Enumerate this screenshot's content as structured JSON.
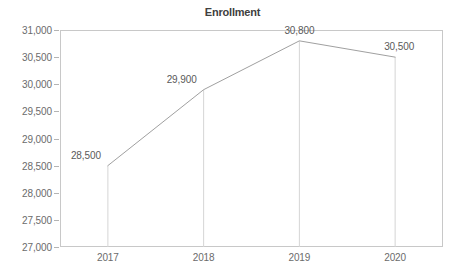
{
  "chart_data": {
    "type": "line",
    "title": "Enrollment",
    "xlabel": "",
    "ylabel": "",
    "categories": [
      "2017",
      "2018",
      "2019",
      "2020"
    ],
    "values": [
      28500,
      29900,
      30800,
      30500
    ],
    "point_labels": [
      "28,500",
      "29,900",
      "30,800",
      "30,500"
    ],
    "ylim": [
      27000,
      31000
    ],
    "y_ticks": [
      31000,
      30500,
      30000,
      29500,
      29000,
      28500,
      28000,
      27500,
      27000
    ],
    "y_tick_labels": [
      "31,000",
      "30,500",
      "30,000",
      "29,500",
      "29,000",
      "28,500",
      "28,000",
      "27,500",
      "27,000"
    ],
    "grid": false,
    "droplines": true,
    "legend": null,
    "legend_position": "none",
    "colors": {
      "line": "#a0a0a0",
      "dropline": "#d5d5d5",
      "frame": "#c8c8c8",
      "text": "#6b6b6b",
      "title": "#404040",
      "background": "#ffffff"
    }
  },
  "labels": {
    "title": "Enrollment"
  }
}
